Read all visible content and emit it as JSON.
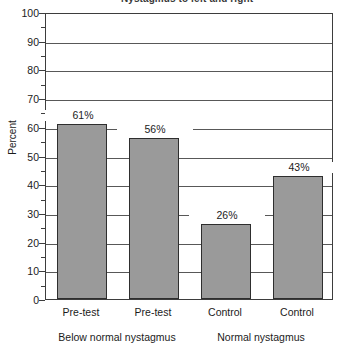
{
  "chart_data": {
    "type": "bar",
    "title": "Nystagmus to left and right",
    "xlabel": "",
    "ylabel": "Percent",
    "ylim": [
      0,
      100
    ],
    "ytick_step": 10,
    "yticks": [
      "0",
      "10",
      "20",
      "30",
      "40",
      "50",
      "60",
      "70",
      "80",
      "90",
      "100"
    ],
    "minor_tick_step": 5,
    "grid": "horizontal",
    "legend": "none",
    "categories": [
      "Pre-test",
      "Pre-test",
      "Control",
      "Control"
    ],
    "values": [
      61,
      56,
      26,
      43
    ],
    "data_labels": [
      "61%",
      "56%",
      "26%",
      "43%"
    ],
    "groups": [
      {
        "label": "Below normal nystagmus",
        "categories": [
          "Pre-test",
          "Pre-test"
        ]
      },
      {
        "label": "Normal nystagmus",
        "categories": [
          "Control",
          "Control"
        ]
      }
    ],
    "bar_color": "#9a9a9a",
    "bar_edge_color": "#2e2e2e",
    "axis_color": "#3d3d3d",
    "grid_color": "#585858"
  }
}
